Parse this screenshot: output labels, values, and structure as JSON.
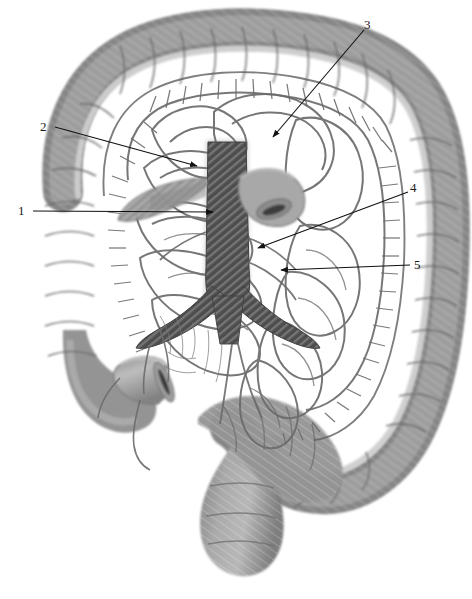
{
  "figure": {
    "background_color": "#ffffff",
    "width": 472,
    "height": 599
  },
  "palette": {
    "background": "#ffffff",
    "colon_wall_mid": "#8d8d8d",
    "colon_wall_dark": "#6f6f6f",
    "colon_wall_light": "#b4b4b4",
    "taenia_band": "#cfcfcf",
    "vessel_line": "#5a5a5a",
    "arcade_line": "#6b6b6b",
    "aorta_hatch_dark": "#4a4a4a",
    "aorta_hatch_light": "#7a7a7a",
    "ileum_stub": "#9a9a9a",
    "leader_line": "#111111",
    "label_text": "#1a1a1a",
    "outline": "#4f4f4f"
  },
  "labels": [
    {
      "id": "label-1",
      "text": "1",
      "x": 18,
      "y": 204,
      "leader": {
        "from_x": 33,
        "from_y": 211,
        "to_x": 213,
        "to_y": 212
      }
    },
    {
      "id": "label-2",
      "text": "2",
      "x": 40,
      "y": 120,
      "leader": {
        "from_x": 55,
        "from_y": 127,
        "to_x": 197,
        "to_y": 166
      }
    },
    {
      "id": "label-3",
      "text": "3",
      "x": 364,
      "y": 18,
      "leader": {
        "from_x": 364,
        "from_y": 30,
        "to_x": 273,
        "to_y": 137
      }
    },
    {
      "id": "label-4",
      "text": "4",
      "x": 410,
      "y": 181,
      "leader": {
        "from_x": 408,
        "from_y": 192,
        "to_x": 258,
        "to_y": 248
      }
    },
    {
      "id": "label-5",
      "text": "5",
      "x": 414,
      "y": 258,
      "leader": {
        "from_x": 410,
        "from_y": 265,
        "to_x": 281,
        "to_y": 270
      }
    }
  ],
  "structures": {
    "ascending_colon": "ascending-colon",
    "transverse_colon": "transverse-colon",
    "descending_colon": "descending-colon",
    "sigmoid_colon": "sigmoid-colon",
    "rectum": "rectum",
    "cecum": "cecum",
    "ileum_stub": "cut-ileum",
    "aorta": "abdominal-aorta",
    "aortic_bifurcation": "aortic-bifurcation",
    "mesenteric_arcades": "mesenteric-arcades",
    "marginal_artery": "marginal-artery",
    "vasa_recta": "vasa-recta",
    "taenia_coli": "taenia-coli"
  }
}
